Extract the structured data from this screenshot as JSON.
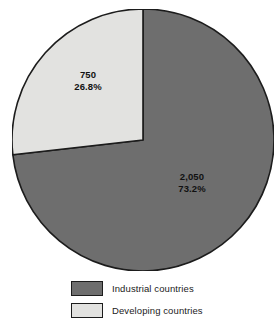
{
  "figure": {
    "title_remnant": "Sources of funds",
    "background_color": "#ffffff"
  },
  "chart_data": {
    "type": "pie",
    "title": "",
    "xlabel": "",
    "ylabel": "",
    "total": 2800,
    "start_angle_deg": 0,
    "direction": "clockwise",
    "grid": false,
    "legend_position": "bottom",
    "categories": [
      "Industrial countries",
      "Developing countries"
    ],
    "values": [
      2050,
      750
    ],
    "value_labels": [
      "2,050",
      "750"
    ],
    "percents": [
      73.2,
      26.8
    ],
    "percent_labels": [
      "73.2%",
      "26.8%"
    ],
    "colors": [
      "#6e6e6e",
      "#e2e2e0"
    ],
    "slices": [
      {
        "name": "Industrial countries",
        "value": 2050,
        "value_label": "2,050",
        "percent": 73.2,
        "percent_label": "73.2%",
        "color": "#6e6e6e"
      },
      {
        "name": "Developing countries",
        "value": 750,
        "value_label": "750",
        "percent": 26.8,
        "percent_label": "26.8%",
        "color": "#e2e2e0"
      }
    ]
  },
  "legend": {
    "items": [
      {
        "label": "Industrial countries",
        "color": "#6e6e6e"
      },
      {
        "label": "Developing countries",
        "color": "#e2e2e0"
      }
    ]
  },
  "style": {
    "slice_outline_color": "#1c1c1c",
    "text_color": "#111111"
  }
}
